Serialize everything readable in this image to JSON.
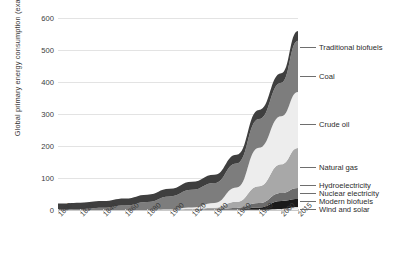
{
  "chart_data": {
    "type": "area",
    "title": "",
    "xlabel": "",
    "ylabel": "Global primary energy consumption (exajoules)",
    "ylim": [
      0,
      600
    ],
    "xlim": [
      1800,
      2015
    ],
    "grid": true,
    "stacked": true,
    "legend_position": "right-callouts",
    "yticks": [
      0,
      100,
      200,
      300,
      400,
      500,
      600
    ],
    "ytick_labels": [
      "0",
      "100",
      "200",
      "300",
      "400",
      "500",
      "600"
    ],
    "xticks": [
      1800,
      1820,
      1840,
      1860,
      1880,
      1900,
      1920,
      1940,
      1960,
      1980,
      2000,
      2015
    ],
    "xtick_labels": [
      "1800",
      "1820",
      "1840",
      "1860",
      "1880",
      "1900",
      "1920",
      "1940",
      "1960",
      "1980",
      "2000",
      "2015"
    ],
    "x": [
      1800,
      1820,
      1840,
      1860,
      1880,
      1900,
      1920,
      1940,
      1960,
      1980,
      2000,
      2015
    ],
    "series": [
      {
        "name": "Wind and solar",
        "color": "#f2f2f2",
        "values": [
          0,
          0,
          0,
          0,
          0,
          0,
          0,
          0,
          0,
          0.2,
          1,
          5
        ]
      },
      {
        "name": "Modern biofuels",
        "color": "#d9d9d9",
        "values": [
          0,
          0,
          0,
          0,
          0,
          0,
          0,
          0,
          0,
          0.3,
          2,
          4
        ]
      },
      {
        "name": "Nuclear electricity",
        "color": "#1a1a1a",
        "values": [
          0,
          0,
          0,
          0,
          0,
          0,
          0,
          0,
          0.5,
          7,
          25,
          25
        ]
      },
      {
        "name": "Hydroelectricity",
        "color": "#6b6b6b",
        "values": [
          0,
          0,
          0,
          0,
          0,
          0.2,
          1,
          2,
          6,
          14,
          25,
          35
        ]
      },
      {
        "name": "Natural gas",
        "color": "#a8a8a8",
        "values": [
          0,
          0,
          0,
          0,
          0,
          1,
          2,
          5,
          19,
          53,
          90,
          125
        ]
      },
      {
        "name": "Crude oil",
        "color": "#ededed",
        "values": [
          0,
          0,
          0,
          0,
          0,
          1,
          5,
          15,
          45,
          120,
          150,
          175
        ]
      },
      {
        "name": "Coal",
        "color": "#7d7d7d",
        "values": [
          1,
          3,
          7,
          14,
          25,
          40,
          55,
          62,
          75,
          90,
          105,
          160
        ]
      },
      {
        "name": "Traditional biofuels",
        "color": "#3f3f3f",
        "values": [
          19,
          20,
          21,
          22,
          23,
          24,
          25,
          26,
          27,
          28,
          29,
          30
        ]
      }
    ],
    "annotations": [
      {
        "label": "Traditional biofuels",
        "at_y": 510
      },
      {
        "label": "Coal",
        "at_y": 420
      },
      {
        "label": "Crude oil",
        "at_y": 270
      },
      {
        "label": "Natural gas",
        "at_y": 135
      },
      {
        "label": "Hydroelectricity",
        "at_y": 78
      },
      {
        "label": "Nuclear electricity",
        "at_y": 52
      },
      {
        "label": "Modern biofuels",
        "at_y": 28
      },
      {
        "label": "Wind and solar",
        "at_y": 4
      }
    ]
  },
  "colors": {
    "gridline": "#e3e3e3",
    "baseline": "#c9c9c9",
    "text": "#3b3b3b",
    "leader": "#6e6e6e",
    "background": "#ffffff"
  }
}
